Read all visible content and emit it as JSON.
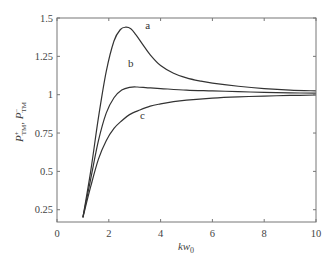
{
  "chart_data": {
    "type": "line",
    "title": "",
    "xlabel": "kw0",
    "xlabel_main": "kw",
    "xlabel_sub": "0",
    "ylabel": "P+_TM, P-_TM",
    "ylabel_parts": {
      "p1": "P",
      "sup1": "+",
      "sub1": "TM",
      "sep": ", ",
      "p2": "P",
      "sup2": "−",
      "sub2": "TM"
    },
    "xlim": [
      0,
      10
    ],
    "ylim": [
      0.17,
      1.5
    ],
    "x_ticks": [
      0,
      2,
      4,
      6,
      8,
      10
    ],
    "x_tick_labels": [
      "0",
      "2",
      "4",
      "6",
      "8",
      "10"
    ],
    "y_ticks": [
      0.25,
      0.5,
      0.75,
      1,
      1.25,
      1.5
    ],
    "y_tick_labels": [
      "0.25",
      "0.5",
      "0.75",
      "1",
      "1.25",
      "1.5"
    ],
    "grid": false,
    "legend": "none (inline curve labels)",
    "series": [
      {
        "name": "a",
        "label_pos": [
          3.5,
          1.43
        ],
        "x": [
          1.0,
          1.3,
          1.6,
          1.9,
          2.2,
          2.45,
          2.65,
          2.85,
          3.05,
          3.3,
          3.6,
          4.0,
          4.5,
          5.0,
          5.5,
          6.0,
          7.0,
          8.0,
          9.0,
          10.0
        ],
        "y": [
          0.2,
          0.5,
          0.85,
          1.15,
          1.35,
          1.425,
          1.44,
          1.43,
          1.39,
          1.33,
          1.26,
          1.19,
          1.14,
          1.11,
          1.09,
          1.075,
          1.055,
          1.04,
          1.03,
          1.025
        ]
      },
      {
        "name": "b",
        "label_pos": [
          2.85,
          1.18
        ],
        "x": [
          1.0,
          1.3,
          1.6,
          1.9,
          2.2,
          2.5,
          2.8,
          3.1,
          3.5,
          4.0,
          5.0,
          6.0,
          7.0,
          8.0,
          9.0,
          10.0
        ],
        "y": [
          0.2,
          0.45,
          0.7,
          0.88,
          0.98,
          1.03,
          1.048,
          1.05,
          1.045,
          1.04,
          1.03,
          1.025,
          1.02,
          1.015,
          1.012,
          1.01
        ]
      },
      {
        "name": "c",
        "label_pos": [
          3.3,
          0.84
        ],
        "x": [
          1.0,
          1.3,
          1.6,
          1.9,
          2.2,
          2.5,
          2.8,
          3.2,
          3.6,
          4.0,
          4.5,
          5.0,
          6.0,
          7.0,
          8.0,
          9.0,
          10.0
        ],
        "y": [
          0.2,
          0.4,
          0.58,
          0.7,
          0.78,
          0.83,
          0.87,
          0.9,
          0.925,
          0.94,
          0.955,
          0.965,
          0.978,
          0.986,
          0.991,
          0.995,
          0.998
        ]
      }
    ]
  }
}
